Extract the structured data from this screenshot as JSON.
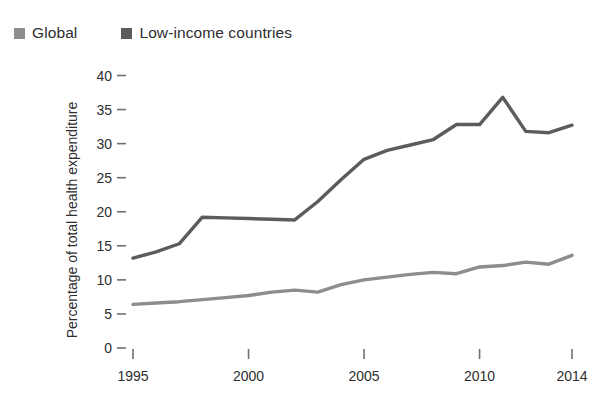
{
  "legend": {
    "items": [
      {
        "label": "Global",
        "color": "#8d8d8d",
        "swatch_name": "legend-swatch-global"
      },
      {
        "label": "Low-income countries",
        "color": "#5c5c5c",
        "swatch_name": "legend-swatch-low-income"
      }
    ]
  },
  "axes": {
    "ylabel": "Percentage of total health expenditure",
    "xlabel": "",
    "yticks": [
      "0",
      "5",
      "10",
      "15",
      "20",
      "25",
      "30",
      "35",
      "40"
    ],
    "xticks": [
      "1995",
      "2000",
      "2005",
      "2010",
      "2014"
    ]
  },
  "chart_data": {
    "type": "line",
    "title": "",
    "xlabel": "",
    "ylabel": "Percentage of total health expenditure",
    "xlim": [
      1995,
      2014
    ],
    "ylim": [
      0,
      40
    ],
    "ytick_values": [
      0,
      5,
      10,
      15,
      20,
      25,
      30,
      35,
      40
    ],
    "xtick_values": [
      1995,
      2000,
      2005,
      2010,
      2014
    ],
    "grid": false,
    "legend_position": "top-left",
    "x": [
      1995,
      1996,
      1997,
      1998,
      1999,
      2000,
      2001,
      2002,
      2003,
      2004,
      2005,
      2006,
      2007,
      2008,
      2009,
      2010,
      2011,
      2012,
      2013,
      2014
    ],
    "series": [
      {
        "name": "Global",
        "color": "#8d8d8d",
        "values": [
          6.4,
          6.6,
          6.8,
          7.1,
          7.4,
          7.7,
          8.2,
          8.5,
          8.2,
          9.3,
          10.0,
          10.4,
          10.8,
          11.1,
          10.9,
          11.9,
          12.1,
          12.6,
          12.3,
          13.6
        ]
      },
      {
        "name": "Low-income countries",
        "color": "#5c5c5c",
        "values": [
          13.2,
          14.1,
          15.3,
          19.2,
          19.1,
          19.0,
          18.9,
          18.8,
          21.5,
          24.7,
          27.7,
          29.0,
          29.8,
          30.6,
          32.8,
          32.8,
          36.8,
          31.8,
          31.6,
          32.7
        ]
      }
    ]
  }
}
